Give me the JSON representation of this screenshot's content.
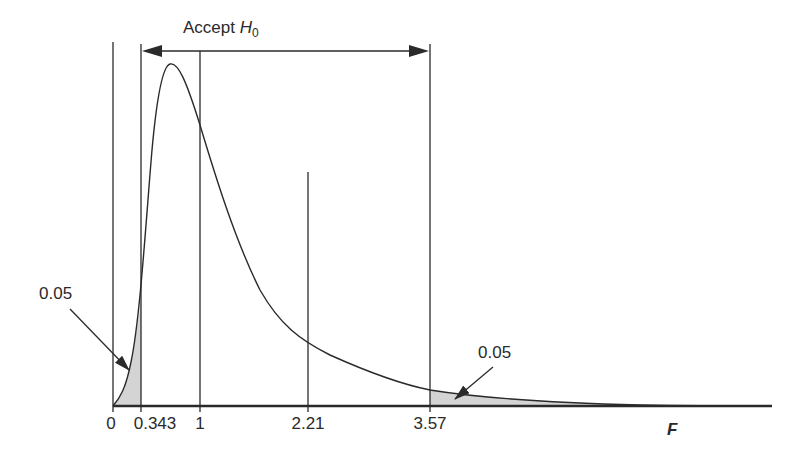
{
  "diagram": {
    "accept_label": "Accept",
    "accept_symbol": "H",
    "accept_subscript": "0",
    "axis_variable": "F",
    "left_tail_area": "0.05",
    "right_tail_area": "0.05",
    "ticks": [
      {
        "value": 0,
        "label": "0",
        "x": 113
      },
      {
        "value": 0.343,
        "label": "0.343",
        "x": 141
      },
      {
        "value": 1,
        "label": "1",
        "x": 200
      },
      {
        "value": 2.21,
        "label": "2.21",
        "x": 308
      },
      {
        "value": 3.57,
        "label": "3.57",
        "x": 430
      }
    ],
    "lower_critical_value": "0.343",
    "upper_critical_value": "3.57",
    "observed_statistic": "2.21",
    "colors": {
      "line": "#2a2a2a",
      "shade": "#d4d4d4",
      "background": "#ffffff"
    }
  }
}
